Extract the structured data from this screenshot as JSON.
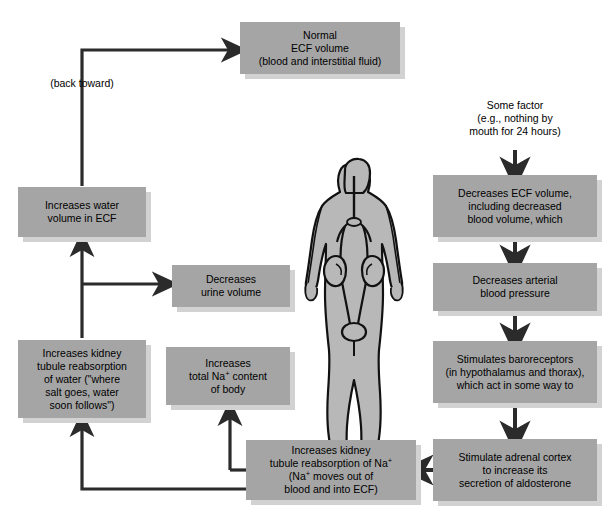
{
  "diagram": {
    "colors": {
      "box_fill": "#a5a5a5",
      "box_shadow": "#d2d2d2",
      "body_fill": "#b8b8b8",
      "arrow": "#2b2b2b",
      "text": "#000000",
      "background": "#ffffff"
    },
    "boxes": [
      {
        "id": "normal-ecf-volume",
        "lines": [
          "Normal",
          "ECF volume",
          "(blood and interstitial fluid)"
        ]
      },
      {
        "id": "increases-water-volume-ecf",
        "lines": [
          "Increases water",
          "volume in ECF"
        ]
      },
      {
        "id": "decreases-urine-volume",
        "lines": [
          "Decreases",
          "urine volume"
        ]
      },
      {
        "id": "increases-kidney-reabsorption-water",
        "lines": [
          "Increases kidney",
          "tubule reabsorption",
          "of water (\"where",
          "salt goes, water",
          "soon follows\")"
        ]
      },
      {
        "id": "increases-total-na-content",
        "lines": [
          "Increases",
          "total Na+ content",
          "of body"
        ]
      },
      {
        "id": "increases-kidney-reabsorption-na",
        "lines": [
          "Increases kidney",
          "tubule reabsorption of Na+",
          "(Na+ moves out of",
          "blood and into ECF)"
        ]
      },
      {
        "id": "decreases-ecf-volume",
        "lines": [
          "Decreases ECF volume,",
          "including decreased",
          "blood volume, which"
        ]
      },
      {
        "id": "decreases-arterial-blood-pressure",
        "lines": [
          "Decreases arterial",
          "blood pressure"
        ]
      },
      {
        "id": "stimulates-baroreceptors",
        "lines": [
          "Stimulates baroreceptors",
          "(in hypothalamus and thorax),",
          "which act in some way to"
        ]
      },
      {
        "id": "stimulate-adrenal-cortex",
        "lines": [
          "Stimulate adrenal cortex",
          "to increase its",
          "secretion of aldosterone"
        ]
      }
    ],
    "labels": {
      "back_toward": "(back toward)",
      "some_factor_line1": "Some factor",
      "some_factor_line2": "(e.g., nothing by",
      "some_factor_line3": "mouth for 24 hours)"
    },
    "figure": {
      "name": "human-body-urinary-system",
      "description": "Standing human figure showing kidneys, ureters and bladder"
    }
  }
}
